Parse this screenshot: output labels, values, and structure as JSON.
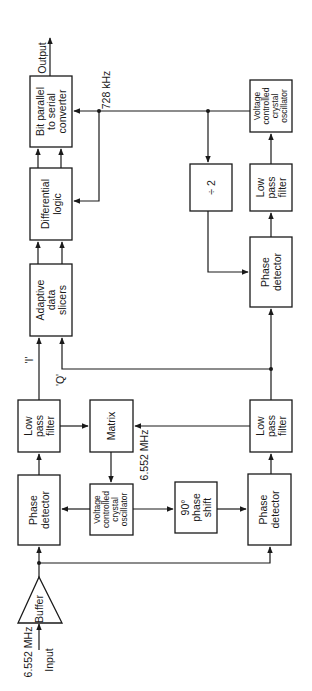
{
  "diagram": {
    "orientation": "rotated 90deg counter-clockwise",
    "blocks": {
      "bit_converter": {
        "lines": [
          "Bit parallel",
          "to serial",
          "converter"
        ]
      },
      "differential_logic": {
        "lines": [
          "Differential",
          "logic"
        ]
      },
      "adaptive_slicers": {
        "lines": [
          "Adaptive",
          "data",
          "slicers"
        ]
      },
      "lpf_i": {
        "lines": [
          "Low",
          "pass",
          "filter"
        ]
      },
      "matrix": {
        "lines": [
          "Matrix"
        ]
      },
      "phase_detector_i": {
        "lines": [
          "Phase",
          "detector"
        ]
      },
      "vcxo_main": {
        "lines": [
          "Voltage",
          "controlled",
          "crystal",
          "oscillator"
        ]
      },
      "phase_shift": {
        "lines": [
          "90°",
          "phase",
          "shift"
        ]
      },
      "phase_detector_q": {
        "lines": [
          "Phase",
          "detector"
        ]
      },
      "lpf_q": {
        "lines": [
          "Low",
          "pass",
          "filter"
        ]
      },
      "phase_detector_clk": {
        "lines": [
          "Phase",
          "detector"
        ]
      },
      "divide2": {
        "lines": [
          "÷ 2"
        ]
      },
      "lpf_clk": {
        "lines": [
          "Low",
          "pass",
          "filter"
        ]
      },
      "vcxo_clk": {
        "lines": [
          "Voltage",
          "controlled",
          "crystal",
          "oscillator"
        ]
      },
      "buffer": {
        "lines": [
          "Buffer"
        ]
      }
    },
    "labels": {
      "output": "Output",
      "input": "Input",
      "input_freq": "6.552 MHz",
      "vco_freq": "6.552 MHz",
      "clock_freq": "728 kHz",
      "i_channel": "'I'",
      "q_channel": "'Q'"
    }
  }
}
